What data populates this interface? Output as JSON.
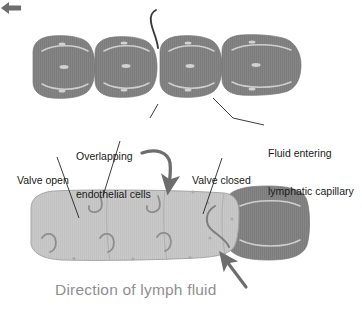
{
  "figure": {
    "caption": "Direction of lymph fluid",
    "caption_arrow_icon": "left-arrow-icon"
  },
  "colors": {
    "dark_vessel": "#858585",
    "dark_vessel_edge": "#6f6f6f",
    "light_vessel": "#c9c9c9",
    "light_vessel_edge": "#9a9a9a",
    "highlight": "#d9d9d9",
    "leader_line": "#1a1a1a",
    "thick_arrow": "#6d6d6d",
    "caption_text": "#8f8f8f",
    "label_text": "#1a1a1a",
    "background": "#ffffff"
  },
  "labels": [
    {
      "id": "overlapping-endothelial-cells",
      "line1": "Overlapping",
      "line2": "endothelial cells",
      "x": 76,
      "y": 125
    },
    {
      "id": "valve-open",
      "line1": "Valve open",
      "line2": "",
      "x": 17,
      "y": 150
    },
    {
      "id": "valve-closed",
      "line1": "Valve closed",
      "line2": "",
      "x": 192,
      "y": 150
    },
    {
      "id": "fluid-entering-lymphatic-capillary",
      "line1": "Fluid entering",
      "line2": "lymphatic capillary",
      "x": 268,
      "y": 122
    }
  ],
  "upper_vessel": {
    "name": "lymphatic-capillary-closed-state",
    "cell_count": 4,
    "fill": "#858585",
    "has_stripe_texture": true
  },
  "lower_vessel": {
    "name": "lymphatic-capillary-open-state",
    "cell_count": 4,
    "fill": "#c9c9c9",
    "end_segment_fill": "#858585",
    "valve_flap_count": 5
  },
  "annotations": {
    "fluid_inflow_arrow_top": "curved-inflow-line",
    "fluid_inflow_arrow_mid": "thick-curved-down-arrow",
    "fluid_inflow_arrow_bottom": "thick-up-left-arrow"
  }
}
